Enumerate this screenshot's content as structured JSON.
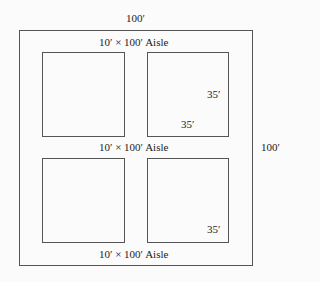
{
  "diagram": {
    "outer_width_label": "100′",
    "outer_height_label": "100′",
    "aisles": [
      {
        "label": "10′ × 100′ Aisle"
      },
      {
        "label": "10′ × 100′ Aisle"
      },
      {
        "label": "10′ × 100′ Aisle"
      }
    ],
    "blocks": [
      {
        "position": "top-left"
      },
      {
        "position": "top-right",
        "height_label": "35′",
        "width_label": "35′"
      },
      {
        "position": "bottom-left"
      },
      {
        "position": "bottom-right",
        "corner_label": "35′"
      }
    ]
  }
}
